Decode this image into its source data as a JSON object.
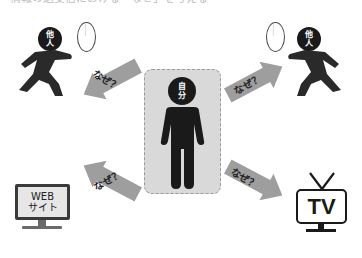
{
  "header": {
    "caption_clipped": "情報の送受信における「なぜ」を考える"
  },
  "center": {
    "label_line1": "自",
    "label_line2": "分",
    "box_color": "#d9d9d9"
  },
  "others": [
    {
      "label_line1": "他",
      "label_line2": "人",
      "bubble_text": "……"
    },
    {
      "label_line1": "他",
      "label_line2": "人",
      "bubble_text": "……"
    }
  ],
  "arrows": [
    {
      "label": "なぜ？",
      "direction": "up-left"
    },
    {
      "label": "なぜ？",
      "direction": "up-right"
    },
    {
      "label": "なぜ？",
      "direction": "down-left"
    },
    {
      "label": "なぜ？",
      "direction": "down-right"
    }
  ],
  "website": {
    "line1": "WEB",
    "line2": "サイト"
  },
  "tv": {
    "label": "TV"
  },
  "colors": {
    "figure": "#1a1a1a",
    "arrow": "#9e9e9e",
    "box": "#d9d9d9"
  }
}
